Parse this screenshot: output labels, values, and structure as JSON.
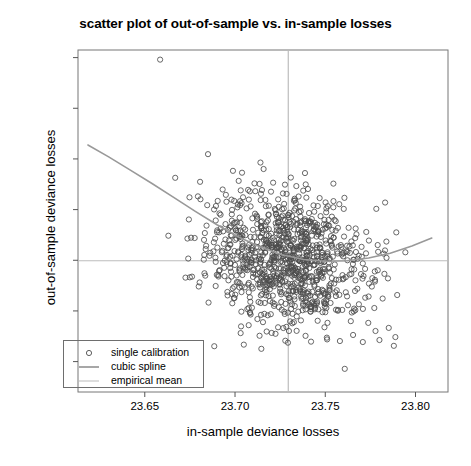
{
  "chart_data": {
    "type": "scatter",
    "title": "scatter plot of out-of-sample vs. in-sample losses",
    "xlabel": "in-sample deviance losses",
    "ylabel": "out-of-sample deviance losses",
    "xlim": [
      23.613,
      23.818
    ],
    "ylim": [
      23.768,
      23.903
    ],
    "xticks": [
      23.65,
      23.7,
      23.75,
      23.8
    ],
    "xtick_labels": [
      "23.65",
      "23.70",
      "23.75",
      "23.80"
    ],
    "yticks": [
      23.78,
      23.8,
      23.82,
      23.84,
      23.86,
      23.88,
      23.9
    ],
    "ytick_labels": [
      "23.78",
      "23.80",
      "23.82",
      "23.84",
      "23.86",
      "23.88",
      "23.90"
    ],
    "grid": false,
    "legend_position": "bottom-left",
    "n_points": 1000,
    "point_color": "#4d4d4d",
    "point_marker": "open-circle",
    "point_radius_px": 2.6,
    "spline_color": "#999999",
    "mean_line_color": "#bdbdbd",
    "empirical_mean_x": 23.7295,
    "empirical_mean_y": 23.8198,
    "series": [
      {
        "name": "single calibration",
        "type": "scatter",
        "marker": "open-circle",
        "color": "#4d4d4d"
      },
      {
        "name": "cubic spline",
        "type": "line",
        "color": "#999999",
        "x": [
          23.6185,
          23.63,
          23.642,
          23.654,
          23.666,
          23.678,
          23.69,
          23.702,
          23.714,
          23.726,
          23.738,
          23.75,
          23.762,
          23.774,
          23.786,
          23.798,
          23.809
        ],
        "y": [
          23.8655,
          23.8608,
          23.8556,
          23.8503,
          23.8448,
          23.8393,
          23.834,
          23.8292,
          23.8252,
          23.8222,
          23.8203,
          23.8196,
          23.8198,
          23.8209,
          23.8228,
          23.8256,
          23.8288
        ]
      },
      {
        "name": "empirical mean",
        "type": "crosshair",
        "color": "#bdbdbd"
      }
    ],
    "annotations": [
      {
        "label": "outlier-top",
        "x": 23.6585,
        "y": 23.8992
      }
    ]
  },
  "legend": {
    "items": [
      {
        "label": "single calibration",
        "key": "open-circle"
      },
      {
        "label": "cubic spline",
        "key": "solid-line-dark"
      },
      {
        "label": "empirical mean",
        "key": "solid-line-light"
      }
    ]
  }
}
